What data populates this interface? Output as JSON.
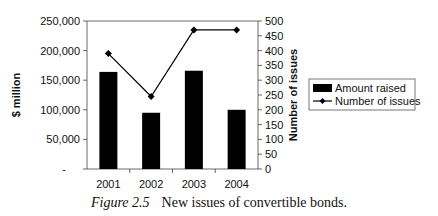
{
  "chart_data": {
    "type": "bar+line",
    "title": "",
    "categories": [
      "2001",
      "2002",
      "2003",
      "2004"
    ],
    "series": [
      {
        "name": "Amount raised",
        "type": "bar",
        "axis": "left",
        "color": "#000000",
        "values": [
          164000,
          95000,
          166000,
          100000
        ]
      },
      {
        "name": "Number of issues",
        "type": "line",
        "axis": "right",
        "color": "#000000",
        "marker": "diamond",
        "values": [
          390,
          245,
          470,
          470
        ]
      }
    ],
    "xlabel": "",
    "ylabel": "$ million",
    "ylabel_right": "Number of issues",
    "ylim": [
      0,
      250000
    ],
    "ylim_right": [
      0,
      500
    ],
    "yticks": [
      "-",
      "50,000",
      "100,000",
      "150,000",
      "200,000",
      "250,000"
    ],
    "yticks_right": [
      "0",
      "50",
      "100",
      "150",
      "200",
      "250",
      "300",
      "350",
      "400",
      "450",
      "500"
    ],
    "grid": false,
    "legend": {
      "position": "right",
      "entries": [
        "Amount raised",
        "Number of issues"
      ]
    }
  },
  "caption": {
    "figure_label": "Figure 2.5",
    "text": "New issues of convertible bonds."
  }
}
